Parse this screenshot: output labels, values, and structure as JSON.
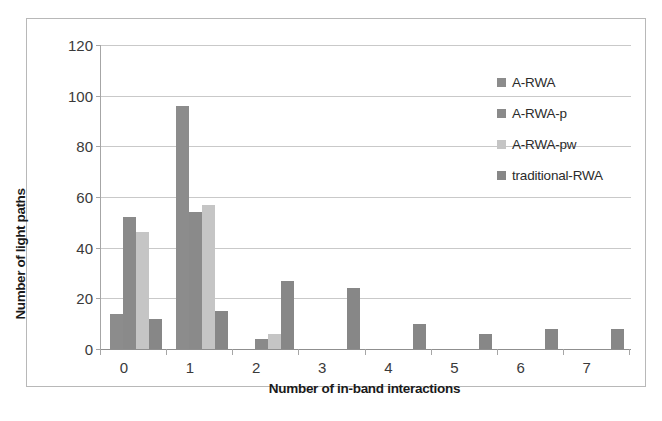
{
  "chart_data": {
    "type": "bar",
    "title": "",
    "xlabel": "Number of in-band interactions",
    "ylabel": "Number of light paths",
    "categories": [
      "0",
      "1",
      "2",
      "3",
      "4",
      "5",
      "6",
      "7"
    ],
    "ylim": [
      0,
      120
    ],
    "yticks": [
      0,
      20,
      40,
      60,
      80,
      100,
      120
    ],
    "grid": true,
    "legend_position": "inside-top-right",
    "series": [
      {
        "name": "A-RWA",
        "color": "#8c8c8c",
        "values": [
          14,
          96,
          0,
          0,
          0,
          0,
          0,
          0
        ]
      },
      {
        "name": "A-RWA-p",
        "color": "#8a8a8a",
        "values": [
          52,
          54,
          4,
          0,
          0,
          0,
          0,
          0
        ]
      },
      {
        "name": "A-RWA-pw",
        "color": "#c5c5c5",
        "values": [
          46,
          57,
          6,
          0,
          0,
          0,
          0,
          0
        ]
      },
      {
        "name": "traditional-RWA",
        "color": "#878787",
        "values": [
          12,
          15,
          27,
          24,
          10,
          6,
          8,
          8
        ]
      }
    ]
  },
  "axes": {
    "y_tick_labels": [
      "0",
      "20",
      "40",
      "60",
      "80",
      "100",
      "120"
    ],
    "x_tick_labels": [
      "0",
      "1",
      "2",
      "3",
      "4",
      "5",
      "6",
      "7"
    ]
  },
  "legend": {
    "entries": [
      {
        "label": "A-RWA"
      },
      {
        "label": "A-RWA-p"
      },
      {
        "label": "A-RWA-pw"
      },
      {
        "label": "traditional-RWA"
      }
    ]
  }
}
